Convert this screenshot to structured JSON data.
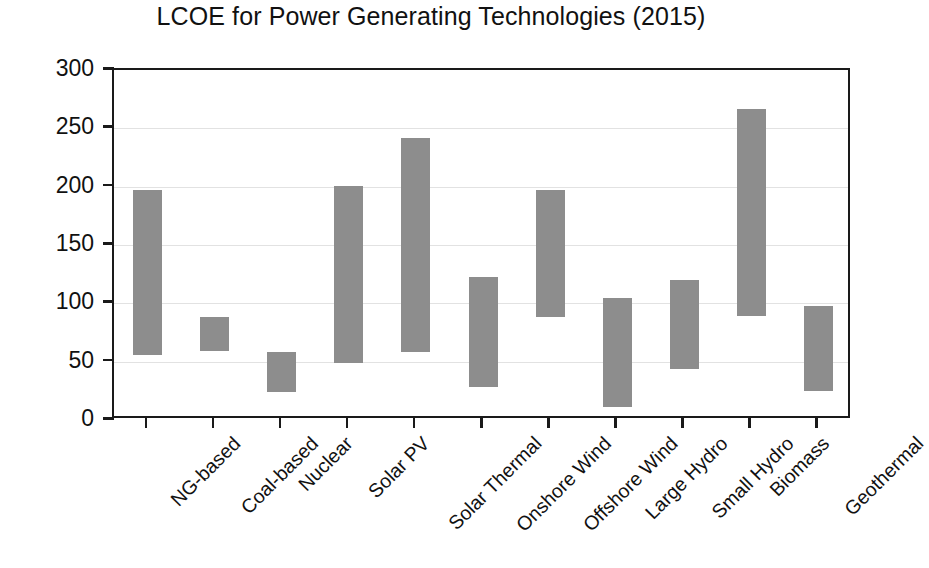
{
  "chart_data": {
    "type": "bar",
    "bar_style": "floating-range",
    "title": "LCOE for Power Generating Technologies (2015)",
    "xlabel": "",
    "ylabel": "LCOE €/MWh",
    "ylim": [
      0,
      300
    ],
    "yticks": [
      0,
      50,
      100,
      150,
      200,
      250,
      300
    ],
    "ytick_labels": [
      "0",
      "50",
      "100",
      "150",
      "200",
      "250",
      "300"
    ],
    "grid": true,
    "grid_axis": "y",
    "legend": false,
    "legend_position": "none",
    "bar_color": "#8d8d8d",
    "axis_color": "#1a1a1a",
    "categories": [
      "NG-based",
      "Coal-based",
      "Nuclear",
      "Solar PV",
      "Solar Thermal",
      "Onshore Wind",
      "Offshore Wind",
      "Large Hydro",
      "Small Hydro",
      "Biomass",
      "Geothermal"
    ],
    "series": [
      {
        "name": "LCOE range low",
        "values": [
          56,
          59,
          24,
          49,
          58,
          28,
          88,
          11,
          44,
          89,
          25
        ]
      },
      {
        "name": "LCOE range high",
        "values": [
          197,
          88,
          58,
          201,
          242,
          123,
          197,
          105,
          120,
          267,
          98
        ]
      }
    ],
    "ranges": [
      {
        "category": "NG-based",
        "low": 56,
        "high": 197
      },
      {
        "category": "Coal-based",
        "low": 59,
        "high": 88
      },
      {
        "category": "Nuclear",
        "low": 24,
        "high": 58
      },
      {
        "category": "Solar PV",
        "low": 49,
        "high": 201
      },
      {
        "category": "Solar Thermal",
        "low": 58,
        "high": 242
      },
      {
        "category": "Onshore Wind",
        "low": 28,
        "high": 123
      },
      {
        "category": "Offshore Wind",
        "low": 88,
        "high": 197
      },
      {
        "category": "Large Hydro",
        "low": 11,
        "high": 105
      },
      {
        "category": "Small Hydro",
        "low": 44,
        "high": 120
      },
      {
        "category": "Biomass",
        "low": 89,
        "high": 267
      },
      {
        "category": "Geothermal",
        "low": 25,
        "high": 98
      }
    ]
  }
}
